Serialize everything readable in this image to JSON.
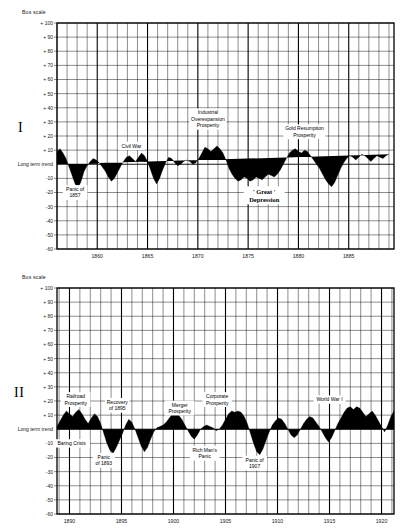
{
  "page": {
    "panels": [
      {
        "roman_numeral": "I",
        "scale_label": "Bus scale",
        "zero_label": "Long term trend",
        "y_ticks": [
          "+ 100",
          "+ 90",
          "+ 80",
          "+ 70",
          "+ 60",
          "+ 50",
          "+ 40",
          "+ 30",
          "+ 20",
          "+ 10",
          "-10",
          "-20",
          "-30",
          "-40",
          "-50",
          "-60"
        ],
        "y_values": [
          100,
          90,
          80,
          70,
          60,
          50,
          40,
          30,
          20,
          10,
          -10,
          -20,
          -30,
          -40,
          -50,
          -60
        ],
        "x_ticks": [
          "1860",
          "1865",
          "1870",
          "1875",
          "1880",
          "1885"
        ],
        "x_tick_values": [
          1860,
          1865,
          1870,
          1875,
          1880,
          1885
        ],
        "annotations": [
          {
            "text_lines": [
              "Civil War"
            ],
            "x": 1863.4,
            "y": 13,
            "bold": false
          },
          {
            "text_lines": [
              "Industrial",
              "Overexpansion",
              "Prosperity"
            ],
            "x": 1871.0,
            "y": 32,
            "bold": false
          },
          {
            "text_lines": [
              "Gold Resumption",
              "Prosperity"
            ],
            "x": 1880.6,
            "y": 23,
            "bold": false
          },
          {
            "text_lines": [
              "Panic of",
              "1857"
            ],
            "x": 1857.8,
            "y": -20,
            "bold": false
          },
          {
            "text_lines": [
              "' Great '",
              "Depression"
            ],
            "x": 1876.6,
            "y": -22,
            "bold": true
          }
        ]
      },
      {
        "roman_numeral": "II",
        "scale_label": "Bus scale",
        "zero_label": "Long term trend",
        "y_ticks": [
          "+ 100",
          "+ 90",
          "+ 80",
          "+ 70",
          "+ 60",
          "+ 50",
          "+ 40",
          "+ 30",
          "+ 20",
          "+ 10",
          "-10",
          "-20",
          "-30",
          "-40",
          "-50",
          "-60"
        ],
        "y_values": [
          100,
          90,
          80,
          70,
          60,
          50,
          40,
          30,
          20,
          10,
          -10,
          -20,
          -30,
          -40,
          -50,
          -60
        ],
        "x_ticks": [
          "1890",
          "1895",
          "1900",
          "1905",
          "1910",
          "1915",
          "1920"
        ],
        "x_tick_values": [
          1890,
          1895,
          1900,
          1905,
          1910,
          1915,
          1920
        ],
        "annotations": [
          {
            "text_lines": [
              "Railroad",
              "Prosperity"
            ],
            "x": 1890.6,
            "y": 21,
            "bold": false
          },
          {
            "text_lines": [
              "Recovery",
              "of 1895"
            ],
            "x": 1894.6,
            "y": 17,
            "bold": false
          },
          {
            "text_lines": [
              "Merger",
              "Prosperity"
            ],
            "x": 1900.6,
            "y": 15,
            "bold": false
          },
          {
            "text_lines": [
              "Corporate",
              "Prosperity"
            ],
            "x": 1904.2,
            "y": 21,
            "bold": false
          },
          {
            "text_lines": [
              "World War I"
            ],
            "x": 1915.0,
            "y": 21,
            "bold": false
          },
          {
            "text_lines": [
              "Baring Crisis"
            ],
            "x": 1890.2,
            "y": -10,
            "bold": false
          },
          {
            "text_lines": [
              "Panic",
              "of 1893"
            ],
            "x": 1893.3,
            "y": -22,
            "bold": false
          },
          {
            "text_lines": [
              "Rich Man's",
              "Panic"
            ],
            "x": 1903.0,
            "y": -17,
            "bold": false
          },
          {
            "text_lines": [
              "Panic of",
              "1907"
            ],
            "x": 1907.8,
            "y": -24,
            "bold": false
          }
        ]
      }
    ]
  },
  "chart_data": [
    {
      "type": "area",
      "title": "Business Activity vs Long Term Trend 1856-1889",
      "xlabel": "",
      "ylabel": "Bus scale",
      "xlim": [
        1856.0,
        1889.5
      ],
      "ylim": [
        -60,
        100
      ],
      "grid": true,
      "legend": "none",
      "series_name": "Deviation from long term trend (%)",
      "x": [
        1856.0,
        1856.3,
        1856.6,
        1856.9,
        1857.2,
        1857.5,
        1857.8,
        1858.1,
        1858.4,
        1858.7,
        1859.0,
        1859.3,
        1859.6,
        1859.9,
        1860.2,
        1860.5,
        1860.8,
        1861.1,
        1861.4,
        1861.7,
        1862.0,
        1862.3,
        1862.6,
        1862.9,
        1863.2,
        1863.5,
        1863.8,
        1864.1,
        1864.4,
        1864.7,
        1865.0,
        1865.3,
        1865.6,
        1865.9,
        1866.2,
        1866.5,
        1866.8,
        1867.1,
        1867.4,
        1867.7,
        1868.0,
        1868.3,
        1868.6,
        1868.9,
        1869.2,
        1869.5,
        1869.8,
        1870.1,
        1870.4,
        1870.7,
        1871.0,
        1871.3,
        1871.6,
        1871.9,
        1872.2,
        1872.5,
        1872.8,
        1873.1,
        1873.4,
        1873.7,
        1874.0,
        1874.3,
        1874.6,
        1874.9,
        1875.2,
        1875.5,
        1875.8,
        1876.1,
        1876.4,
        1876.7,
        1877.0,
        1877.3,
        1877.6,
        1877.9,
        1878.2,
        1878.5,
        1878.8,
        1879.1,
        1879.4,
        1879.7,
        1880.0,
        1880.3,
        1880.6,
        1880.9,
        1881.2,
        1881.5,
        1881.8,
        1882.1,
        1882.4,
        1882.7,
        1883.0,
        1883.3,
        1883.6,
        1883.9,
        1884.2,
        1884.5,
        1884.8,
        1885.1,
        1885.4,
        1885.7,
        1886.0,
        1886.3,
        1886.6,
        1886.9,
        1887.2,
        1887.5,
        1887.8,
        1888.1,
        1888.4,
        1888.7,
        1889.0,
        1889.3
      ],
      "values": [
        9,
        11,
        8,
        4,
        -2,
        -8,
        -14,
        -17,
        -12,
        -5,
        -1,
        2,
        4,
        3,
        1,
        -2,
        -5,
        -9,
        -12,
        -10,
        -6,
        -2,
        2,
        5,
        6,
        4,
        2,
        5,
        8,
        6,
        2,
        -4,
        -10,
        -14,
        -10,
        -4,
        1,
        5,
        4,
        1,
        -1,
        0,
        2,
        3,
        2,
        0,
        1,
        4,
        8,
        12,
        11,
        9,
        11,
        13,
        11,
        8,
        3,
        -3,
        -7,
        -10,
        -12,
        -11,
        -9,
        -10,
        -12,
        -11,
        -9,
        -10,
        -11,
        -9,
        -7,
        -8,
        -9,
        -7,
        -4,
        0,
        4,
        8,
        10,
        11,
        9,
        8,
        10,
        9,
        6,
        3,
        0,
        -3,
        -7,
        -11,
        -14,
        -16,
        -13,
        -8,
        -3,
        1,
        4,
        6,
        5,
        3,
        5,
        7,
        6,
        4,
        2,
        4,
        6,
        5,
        4,
        6,
        7
      ],
      "annotations": [
        "Civil War",
        "Industrial Overexpansion Prosperity",
        "Gold Resumption Prosperity",
        "Panic of 1857",
        "' Great ' Depression"
      ]
    },
    {
      "type": "area",
      "title": "Business Activity vs Long Term Trend 1889-1921",
      "xlabel": "",
      "ylabel": "Bus scale",
      "xlim": [
        1888.8,
        1921.2
      ],
      "ylim": [
        -60,
        100
      ],
      "grid": true,
      "legend": "none",
      "series_name": "Deviation from long term trend (%)",
      "x": [
        1888.8,
        1889.1,
        1889.4,
        1889.7,
        1890.0,
        1890.3,
        1890.6,
        1890.9,
        1891.2,
        1891.5,
        1891.8,
        1892.1,
        1892.4,
        1892.7,
        1893.0,
        1893.3,
        1893.6,
        1893.9,
        1894.2,
        1894.5,
        1894.8,
        1895.1,
        1895.4,
        1895.7,
        1896.0,
        1896.3,
        1896.6,
        1896.9,
        1897.2,
        1897.5,
        1897.8,
        1898.1,
        1898.4,
        1898.7,
        1899.0,
        1899.3,
        1899.6,
        1899.9,
        1900.2,
        1900.5,
        1900.8,
        1901.1,
        1901.4,
        1901.7,
        1902.0,
        1902.3,
        1902.6,
        1902.9,
        1903.2,
        1903.5,
        1903.8,
        1904.1,
        1904.4,
        1904.7,
        1905.0,
        1905.3,
        1905.6,
        1905.9,
        1906.2,
        1906.5,
        1906.8,
        1907.1,
        1907.4,
        1907.7,
        1908.0,
        1908.3,
        1908.6,
        1908.9,
        1909.2,
        1909.5,
        1909.8,
        1910.1,
        1910.4,
        1910.7,
        1911.0,
        1911.3,
        1911.6,
        1911.9,
        1912.2,
        1912.5,
        1912.8,
        1913.1,
        1913.4,
        1913.7,
        1914.0,
        1914.3,
        1914.6,
        1914.9,
        1915.2,
        1915.5,
        1915.8,
        1916.1,
        1916.4,
        1916.7,
        1917.0,
        1917.3,
        1917.6,
        1917.9,
        1918.2,
        1918.5,
        1918.8,
        1919.1,
        1919.4,
        1919.7,
        1920.0,
        1920.3,
        1920.6,
        1920.9,
        1921.2
      ],
      "values": [
        2,
        6,
        10,
        13,
        11,
        9,
        12,
        14,
        11,
        7,
        4,
        8,
        11,
        9,
        4,
        -3,
        -10,
        -15,
        -17,
        -13,
        -8,
        -3,
        3,
        7,
        5,
        0,
        -6,
        -12,
        -16,
        -13,
        -7,
        -2,
        1,
        2,
        3,
        5,
        8,
        11,
        12,
        10,
        7,
        3,
        -1,
        -5,
        -7,
        -4,
        0,
        2,
        3,
        2,
        1,
        -1,
        0,
        3,
        7,
        11,
        13,
        12,
        13,
        12,
        9,
        4,
        -3,
        -10,
        -16,
        -18,
        -14,
        -8,
        -2,
        3,
        6,
        8,
        7,
        4,
        0,
        -4,
        -6,
        -4,
        0,
        4,
        7,
        9,
        8,
        5,
        2,
        -2,
        -6,
        -9,
        -6,
        -1,
        4,
        8,
        12,
        15,
        16,
        14,
        16,
        15,
        12,
        9,
        11,
        13,
        10,
        6,
        2,
        -2,
        3,
        9,
        13,
        10
      ],
      "annotations": [
        "Railroad Prosperity",
        "Recovery of 1895",
        "Merger Prosperity",
        "Corporate Prosperity",
        "World War I",
        "Baring Crisis",
        "Panic of 1893",
        "Rich Man's Panic",
        "Panic of 1907"
      ]
    }
  ]
}
